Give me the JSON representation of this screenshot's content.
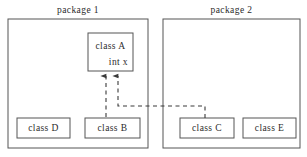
{
  "diagram": {
    "type": "uml-package-dependency",
    "width": 307,
    "height": 157,
    "background_color": "#ffffff",
    "line_color": "#555555",
    "text_color": "#2b2b2b"
  },
  "packages": [
    {
      "id": "package-1",
      "label": "package  1",
      "x": 8,
      "y": 19,
      "width": 140,
      "height": 129
    },
    {
      "id": "package-2",
      "label": "package  2",
      "x": 163,
      "y": 19,
      "width": 137,
      "height": 129
    }
  ],
  "classes": [
    {
      "id": "class-a",
      "title": "class  A",
      "attribute": "int  x",
      "x": 88,
      "y": 33,
      "width": 45,
      "height": 38,
      "package": "package-1"
    },
    {
      "id": "class-d",
      "title": "class  D",
      "attribute": "",
      "x": 17,
      "y": 118,
      "width": 53,
      "height": 20,
      "package": "package-1"
    },
    {
      "id": "class-b",
      "title": "class  B",
      "attribute": "",
      "x": 85,
      "y": 118,
      "width": 55,
      "height": 20,
      "package": "package-1"
    },
    {
      "id": "class-c",
      "title": "class  C",
      "attribute": "",
      "x": 180,
      "y": 118,
      "width": 54,
      "height": 20,
      "package": "package-2"
    },
    {
      "id": "class-e",
      "title": "class  E",
      "attribute": "",
      "x": 243,
      "y": 118,
      "width": 53,
      "height": 20,
      "package": "package-2"
    }
  ],
  "dependencies": [
    {
      "id": "dep-b-to-a",
      "from": "class-b",
      "to": "class-a",
      "style": "dashed",
      "arrowhead": "filled",
      "path": "M 106,117 L 106,74"
    },
    {
      "id": "dep-c-to-a",
      "from": "class-c",
      "to": "class-a",
      "style": "dashed",
      "arrowhead": "filled",
      "path": "M 205,118 L 205,106 L 118,106 L 118,74"
    }
  ]
}
